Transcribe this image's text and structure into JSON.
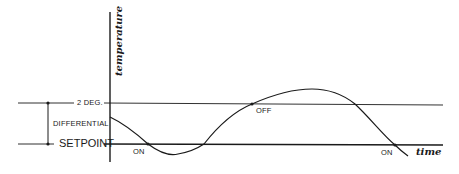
{
  "diagram": {
    "y_axis_label": "temperature",
    "x_axis_label": "time",
    "upper_limit_label": "2 DEG.",
    "differential_label": "DIFFERENTIAL",
    "setpoint_label": "SETPOINT",
    "events": [
      {
        "label": "ON",
        "position": "first setpoint crossing (falling)"
      },
      {
        "label": "OFF",
        "position": "upper limit crossing (rising)"
      },
      {
        "label": "ON",
        "position": "second setpoint crossing (falling)"
      }
    ],
    "colors": {
      "line": "#1a1a1a",
      "background": "#ffffff"
    }
  }
}
